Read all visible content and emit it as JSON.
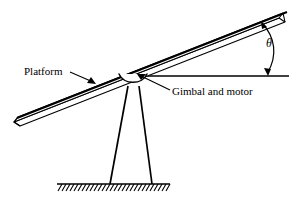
{
  "figure": {
    "labels": {
      "platform": "Platform",
      "gimbal": "Gimbal and motor",
      "angle": "θ"
    },
    "colors": {
      "stroke": "#000000",
      "background": "#ffffff"
    },
    "geometry": {
      "pivot": {
        "x": 133,
        "y": 76
      },
      "platform_tip_right": {
        "x": 286,
        "y": 14
      },
      "platform_tip_left": {
        "x": 14,
        "y": 122
      },
      "horizontal_line_y": 76,
      "horizontal_line_x_end": 289,
      "ground_line_y": 184,
      "ground_x_start": 57,
      "ground_x_end": 170,
      "leg_left_foot_x": 110,
      "leg_right_foot_x": 152,
      "hatch_count": 27,
      "angle_arc_label_position": {
        "x": 272,
        "y": 44
      }
    }
  }
}
